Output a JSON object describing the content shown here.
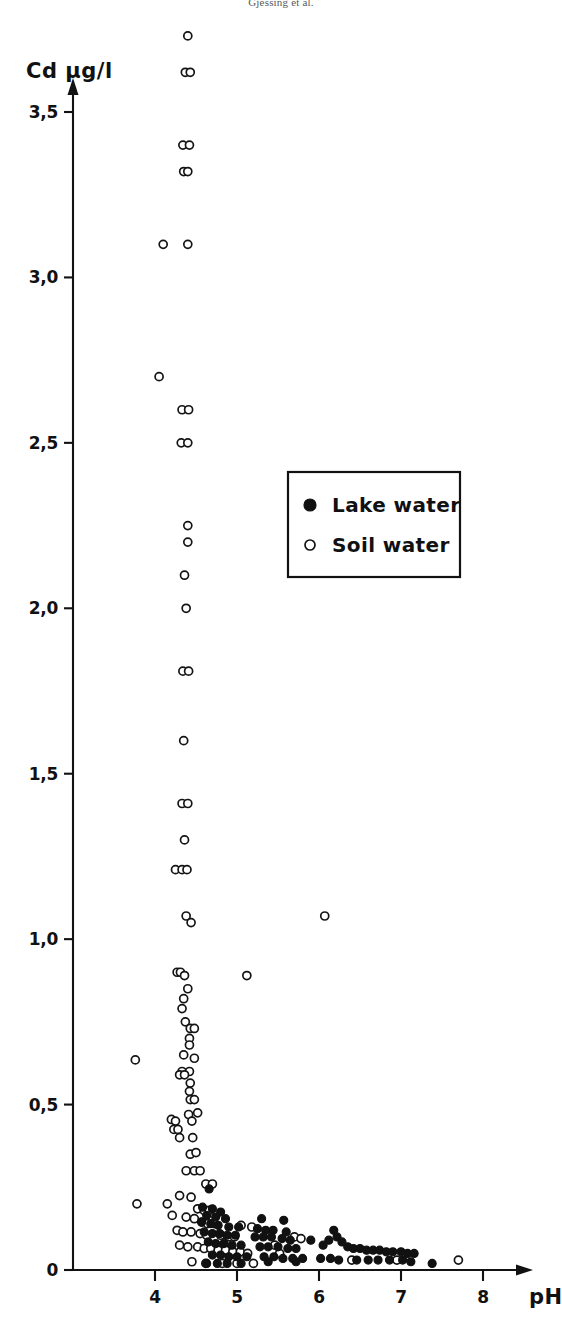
{
  "runninghead": "Gjessing et al.",
  "chart_data": {
    "type": "scatter",
    "title": "",
    "xlabel": "pH",
    "ylabel": "Cd  µg/l",
    "xlim": [
      3.35,
      8.3
    ],
    "ylim": [
      0,
      3.85
    ],
    "grid": false,
    "xticks": [
      4,
      5,
      6,
      7,
      8
    ],
    "xticklabels": [
      "4",
      "5",
      "6",
      "7",
      "8"
    ],
    "yticks": [
      0,
      0.5,
      1.0,
      1.5,
      2.0,
      2.5,
      3.0,
      3.5
    ],
    "yticklabels": [
      "0",
      "0,5",
      "1,0",
      "1,5",
      "2,0",
      "2,5",
      "3,0",
      "3,5"
    ],
    "decimal_separator": ",",
    "legend": {
      "position": "upper-center-right",
      "entries": [
        {
          "name": "Lake water",
          "marker": "filled-circle",
          "color": "#111111"
        },
        {
          "name": "Soil water",
          "marker": "open-circle",
          "color": "#ffffff"
        }
      ]
    },
    "series": [
      {
        "name": "Soil water",
        "marker": "open-circle",
        "points": [
          [
            4.4,
            3.73
          ],
          [
            4.37,
            3.62
          ],
          [
            4.43,
            3.62
          ],
          [
            4.34,
            3.4
          ],
          [
            4.42,
            3.4
          ],
          [
            4.35,
            3.32
          ],
          [
            4.4,
            3.32
          ],
          [
            4.1,
            3.1
          ],
          [
            4.4,
            3.1
          ],
          [
            4.05,
            2.7
          ],
          [
            4.33,
            2.6
          ],
          [
            4.41,
            2.6
          ],
          [
            4.32,
            2.5
          ],
          [
            4.4,
            2.5
          ],
          [
            4.4,
            2.25
          ],
          [
            4.4,
            2.2
          ],
          [
            4.36,
            2.1
          ],
          [
            4.38,
            2.0
          ],
          [
            4.34,
            1.81
          ],
          [
            4.41,
            1.81
          ],
          [
            4.35,
            1.6
          ],
          [
            4.33,
            1.41
          ],
          [
            4.4,
            1.41
          ],
          [
            4.36,
            1.3
          ],
          [
            4.25,
            1.21
          ],
          [
            4.33,
            1.21
          ],
          [
            4.39,
            1.21
          ],
          [
            4.38,
            1.07
          ],
          [
            4.44,
            1.05
          ],
          [
            6.07,
            1.07
          ],
          [
            4.27,
            0.9
          ],
          [
            4.31,
            0.9
          ],
          [
            4.36,
            0.89
          ],
          [
            5.12,
            0.89
          ],
          [
            4.4,
            0.85
          ],
          [
            4.35,
            0.82
          ],
          [
            4.33,
            0.79
          ],
          [
            4.37,
            0.75
          ],
          [
            4.43,
            0.73
          ],
          [
            4.48,
            0.73
          ],
          [
            4.42,
            0.7
          ],
          [
            4.42,
            0.68
          ],
          [
            4.35,
            0.65
          ],
          [
            4.48,
            0.64
          ],
          [
            3.76,
            0.635
          ],
          [
            4.33,
            0.6
          ],
          [
            4.42,
            0.6
          ],
          [
            4.3,
            0.59
          ],
          [
            4.36,
            0.59
          ],
          [
            4.43,
            0.565
          ],
          [
            4.42,
            0.54
          ],
          [
            4.43,
            0.515
          ],
          [
            4.48,
            0.515
          ],
          [
            4.41,
            0.47
          ],
          [
            4.52,
            0.475
          ],
          [
            4.2,
            0.455
          ],
          [
            4.25,
            0.45
          ],
          [
            4.45,
            0.45
          ],
          [
            4.23,
            0.425
          ],
          [
            4.28,
            0.425
          ],
          [
            4.3,
            0.4
          ],
          [
            4.46,
            0.4
          ],
          [
            4.43,
            0.35
          ],
          [
            4.5,
            0.355
          ],
          [
            4.38,
            0.3
          ],
          [
            4.48,
            0.3
          ],
          [
            4.55,
            0.3
          ],
          [
            4.62,
            0.26
          ],
          [
            4.7,
            0.26
          ],
          [
            4.3,
            0.225
          ],
          [
            4.44,
            0.22
          ],
          [
            4.15,
            0.2
          ],
          [
            3.78,
            0.2
          ],
          [
            4.52,
            0.185
          ],
          [
            4.6,
            0.18
          ],
          [
            4.66,
            0.18
          ],
          [
            4.21,
            0.165
          ],
          [
            4.38,
            0.16
          ],
          [
            4.48,
            0.155
          ],
          [
            4.57,
            0.145
          ],
          [
            4.64,
            0.14
          ],
          [
            4.72,
            0.14
          ],
          [
            4.27,
            0.12
          ],
          [
            4.34,
            0.115
          ],
          [
            4.44,
            0.115
          ],
          [
            4.55,
            0.11
          ],
          [
            4.63,
            0.105
          ],
          [
            4.8,
            0.105
          ],
          [
            4.9,
            0.1
          ],
          [
            4.97,
            0.1
          ],
          [
            5.05,
            0.135
          ],
          [
            5.18,
            0.13
          ],
          [
            4.3,
            0.075
          ],
          [
            4.4,
            0.07
          ],
          [
            4.52,
            0.07
          ],
          [
            4.6,
            0.065
          ],
          [
            4.68,
            0.065
          ],
          [
            4.77,
            0.06
          ],
          [
            4.86,
            0.06
          ],
          [
            4.95,
            0.055
          ],
          [
            5.04,
            0.055
          ],
          [
            5.13,
            0.05
          ],
          [
            5.46,
            0.075
          ],
          [
            5.52,
            0.05
          ],
          [
            5.7,
            0.1
          ],
          [
            5.78,
            0.095
          ],
          [
            6.4,
            0.03
          ],
          [
            6.95,
            0.03
          ],
          [
            7.7,
            0.03
          ],
          [
            4.45,
            0.025
          ],
          [
            4.62,
            0.02
          ],
          [
            4.82,
            0.02
          ],
          [
            5.0,
            0.02
          ],
          [
            5.2,
            0.02
          ]
        ]
      },
      {
        "name": "Lake water",
        "marker": "filled-circle",
        "points": [
          [
            4.66,
            0.245
          ],
          [
            4.58,
            0.19
          ],
          [
            4.7,
            0.185
          ],
          [
            4.8,
            0.175
          ],
          [
            4.63,
            0.165
          ],
          [
            4.74,
            0.16
          ],
          [
            4.86,
            0.155
          ],
          [
            5.3,
            0.155
          ],
          [
            5.57,
            0.15
          ],
          [
            4.57,
            0.145
          ],
          [
            4.68,
            0.14
          ],
          [
            4.77,
            0.135
          ],
          [
            4.9,
            0.13
          ],
          [
            5.02,
            0.13
          ],
          [
            5.25,
            0.125
          ],
          [
            5.35,
            0.12
          ],
          [
            5.44,
            0.12
          ],
          [
            5.6,
            0.115
          ],
          [
            4.6,
            0.115
          ],
          [
            4.7,
            0.11
          ],
          [
            4.79,
            0.11
          ],
          [
            4.88,
            0.105
          ],
          [
            4.98,
            0.105
          ],
          [
            5.22,
            0.1
          ],
          [
            5.32,
            0.1
          ],
          [
            5.42,
            0.1
          ],
          [
            5.55,
            0.095
          ],
          [
            5.65,
            0.09
          ],
          [
            5.9,
            0.09
          ],
          [
            6.12,
            0.09
          ],
          [
            4.65,
            0.085
          ],
          [
            4.74,
            0.08
          ],
          [
            4.84,
            0.08
          ],
          [
            4.94,
            0.075
          ],
          [
            5.05,
            0.075
          ],
          [
            5.28,
            0.07
          ],
          [
            5.38,
            0.07
          ],
          [
            5.5,
            0.07
          ],
          [
            5.62,
            0.065
          ],
          [
            5.72,
            0.065
          ],
          [
            6.05,
            0.075
          ],
          [
            6.18,
            0.12
          ],
          [
            6.22,
            0.1
          ],
          [
            6.28,
            0.085
          ],
          [
            6.35,
            0.07
          ],
          [
            6.42,
            0.065
          ],
          [
            6.5,
            0.065
          ],
          [
            6.58,
            0.06
          ],
          [
            6.66,
            0.06
          ],
          [
            6.74,
            0.06
          ],
          [
            6.82,
            0.055
          ],
          [
            6.9,
            0.055
          ],
          [
            7.0,
            0.055
          ],
          [
            7.08,
            0.05
          ],
          [
            7.16,
            0.05
          ],
          [
            7.38,
            0.02
          ],
          [
            4.7,
            0.045
          ],
          [
            4.8,
            0.045
          ],
          [
            4.9,
            0.04
          ],
          [
            5.0,
            0.04
          ],
          [
            5.12,
            0.04
          ],
          [
            5.33,
            0.04
          ],
          [
            5.45,
            0.04
          ],
          [
            5.56,
            0.035
          ],
          [
            5.68,
            0.035
          ],
          [
            5.8,
            0.035
          ],
          [
            6.02,
            0.035
          ],
          [
            6.14,
            0.035
          ],
          [
            6.24,
            0.03
          ],
          [
            6.46,
            0.03
          ],
          [
            6.6,
            0.03
          ],
          [
            6.72,
            0.03
          ],
          [
            6.86,
            0.03
          ],
          [
            7.02,
            0.03
          ],
          [
            7.12,
            0.025
          ],
          [
            4.63,
            0.02
          ],
          [
            4.76,
            0.02
          ],
          [
            4.88,
            0.02
          ],
          [
            5.05,
            0.02
          ],
          [
            5.38,
            0.025
          ],
          [
            5.72,
            0.025
          ]
        ]
      }
    ]
  }
}
